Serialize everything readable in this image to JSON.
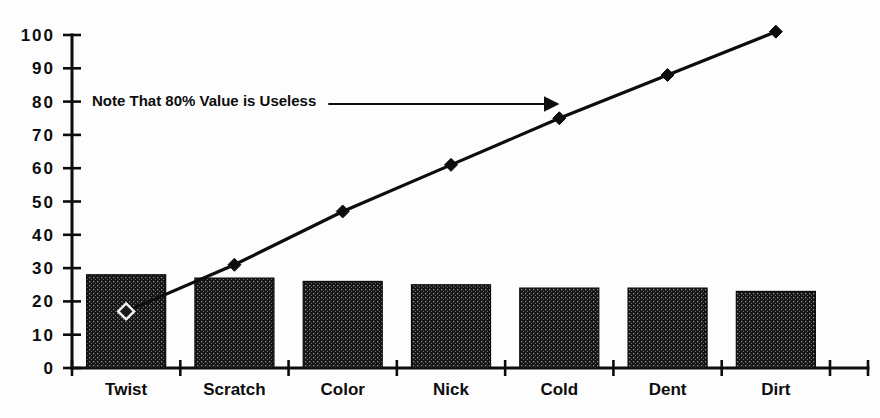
{
  "chart_data": {
    "type": "bar",
    "title": "",
    "subtitle": "",
    "xlabel": "",
    "ylabel": "",
    "ylim": [
      0,
      100
    ],
    "grid": false,
    "legend_position": "none",
    "categories": [
      "Twist",
      "Scratch",
      "Color",
      "Nick",
      "Cold",
      "Dent",
      "Dirt"
    ],
    "ytick_labels": [
      "100",
      "90",
      "80",
      "70",
      "60",
      "50",
      "40",
      "30",
      "20",
      "10",
      "0"
    ],
    "ytick_values": [
      100,
      90,
      80,
      70,
      60,
      50,
      40,
      30,
      20,
      10,
      0
    ],
    "series": [
      {
        "name": "Defect Count",
        "type": "bar",
        "values": [
          28,
          27,
          26,
          25,
          24,
          24,
          23
        ]
      },
      {
        "name": "Cumulative Percent",
        "type": "line",
        "values": [
          17,
          31,
          47,
          61,
          75,
          88,
          101
        ],
        "marker_styles": [
          "hollow",
          "filled",
          "filled",
          "filled",
          "filled",
          "filled",
          "filled"
        ]
      }
    ],
    "annotations": [
      {
        "text": "Note That 80% Value is Useless",
        "arrow": true,
        "arrow_target_category": "Cold",
        "arrow_target_value": 80
      }
    ],
    "colors": {
      "bar_fill": "#151515",
      "bar_pattern": "#8a8a8a",
      "line": "#0d0d0d",
      "axis": "#0d0d0d",
      "text": "#0d0d0d",
      "background": "#fdfdfd"
    }
  }
}
